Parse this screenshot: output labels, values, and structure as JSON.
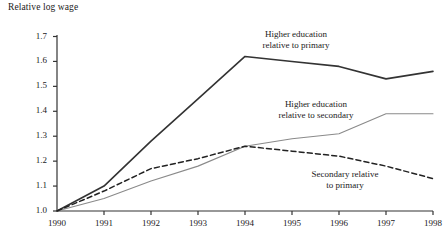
{
  "chart_data": {
    "type": "line",
    "title": "Relative log wage",
    "xlabel": "",
    "ylabel": "Relative log wage",
    "x": [
      1990,
      1991,
      1992,
      1993,
      1994,
      1995,
      1996,
      1997,
      1998
    ],
    "xtick_labels": [
      "1990",
      "1991",
      "1992",
      "1993",
      "1994",
      "1995",
      "1996",
      "1997",
      "1998"
    ],
    "ytick_labels": [
      "1.0",
      "1.1",
      "1.2",
      "1.3",
      "1.4",
      "1.5",
      "1.6",
      "1.7"
    ],
    "ytick_values": [
      1.0,
      1.1,
      1.2,
      1.3,
      1.4,
      1.5,
      1.6,
      1.7
    ],
    "xlim": [
      1990,
      1998
    ],
    "ylim": [
      1.0,
      1.7
    ],
    "grid": false,
    "legend": "inline-annotations",
    "series": [
      {
        "name": "Higher education relative to primary",
        "style": "solid",
        "color": "#333333",
        "width": 1.6,
        "values": [
          1.0,
          1.1,
          1.28,
          1.45,
          1.62,
          1.6,
          1.58,
          1.53,
          1.56
        ]
      },
      {
        "name": "Higher education relative to secondary",
        "style": "solid",
        "color": "#8a8a8a",
        "width": 1.1,
        "values": [
          1.0,
          1.05,
          1.12,
          1.18,
          1.26,
          1.29,
          1.31,
          1.39,
          1.39
        ]
      },
      {
        "name": "Secondary relative to primary",
        "style": "dashed",
        "color": "#222222",
        "width": 1.5,
        "values": [
          1.0,
          1.08,
          1.17,
          1.21,
          1.26,
          1.24,
          1.22,
          1.18,
          1.13
        ]
      }
    ],
    "annotations": [
      {
        "text_line1": "Higher education",
        "text_line2": "relative to primary",
        "x": 296,
        "y": 29
      },
      {
        "text_line1": "Higher education",
        "text_line2": "relative to secondary",
        "x": 316,
        "y": 99
      },
      {
        "text_line1": "Secondary relative",
        "text_line2": "to primary",
        "x": 345,
        "y": 169
      }
    ]
  }
}
